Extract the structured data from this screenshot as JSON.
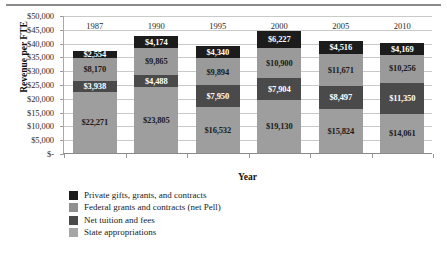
{
  "chart_data": {
    "type": "bar",
    "subtype": "stacked-bar",
    "title": "",
    "xlabel": "Year",
    "ylabel": "Revenue per FTE",
    "categories": [
      "1987",
      "1990",
      "1995",
      "2000",
      "2005",
      "2010"
    ],
    "ylim": [
      0,
      50000
    ],
    "ytick_values": [
      0,
      5000,
      10000,
      15000,
      20000,
      25000,
      30000,
      35000,
      40000,
      45000,
      50000
    ],
    "ytick_labels": [
      "$-",
      "$5,000",
      "$10,000",
      "$15,000",
      "$20,000",
      "$25,000",
      "$30,000",
      "$35,000",
      "$40,000",
      "$45,000",
      "$50,000"
    ],
    "grid": "horizontal",
    "legend_position": "bottom-left",
    "stack_order": "bottom-to-top",
    "series": [
      {
        "name": "State appropriations",
        "color": "#9e9e9e",
        "values": [
          22271,
          23805,
          16532,
          19130,
          15824,
          14061
        ],
        "labels": [
          "$22,271",
          "$23,805",
          "$16,532",
          "$19,130",
          "$15,824",
          "$14,061"
        ]
      },
      {
        "name": "Net tuition and fees",
        "color": "#4a4a4a",
        "values": [
          3938,
          4488,
          7950,
          7904,
          8497,
          11350
        ],
        "labels": [
          "$3,938",
          "$4,488",
          "$7,950",
          "$7,904",
          "$8,497",
          "$11,350"
        ]
      },
      {
        "name": "Federal grants and contracts (net Pell)",
        "color": "#9a9a9a",
        "values": [
          8170,
          9865,
          9894,
          10900,
          11671,
          10256
        ],
        "labels": [
          "$8,170",
          "$9,865",
          "$9,894",
          "$10,900",
          "$11,671",
          "$10,256"
        ]
      },
      {
        "name": "Private gifts, grants, and contracts",
        "color": "#1c1c1c",
        "values": [
          2554,
          4174,
          4340,
          6227,
          4516,
          4169
        ],
        "labels": [
          "$2,554",
          "$4,174",
          "$4,340",
          "$6,227",
          "$4,516",
          "$4,169"
        ]
      }
    ]
  },
  "legend": {
    "items": [
      {
        "label": "Private gifts, grants, and contracts",
        "color": "#1c1c1c"
      },
      {
        "label": "Federal grants and contracts (net Pell)",
        "color": "#8f8f8f"
      },
      {
        "label": "Net tuition and fees",
        "color": "#4a4a4a"
      },
      {
        "label": "State appropriations",
        "color": "#a6a6a6"
      }
    ]
  }
}
